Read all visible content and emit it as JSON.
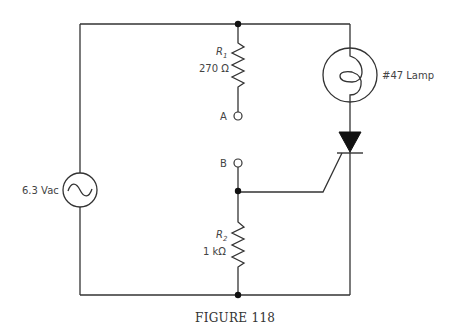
{
  "figure": {
    "caption": "FIGURE 118"
  },
  "components": {
    "source": {
      "label": "6.3 Vac",
      "type": "ac-voltage-source"
    },
    "r1": {
      "name": "R",
      "subscript": "1",
      "value": "270 Ω"
    },
    "r2": {
      "name": "R",
      "subscript": "2",
      "value": "1 kΩ"
    },
    "lamp": {
      "label": "#47 Lamp"
    },
    "terminal_a": {
      "label": "A"
    },
    "terminal_b": {
      "label": "B"
    },
    "scr": {
      "type": "silicon-controlled-rectifier"
    }
  },
  "colors": {
    "wire": "#333333",
    "text": "#444444",
    "background": "#ffffff"
  }
}
